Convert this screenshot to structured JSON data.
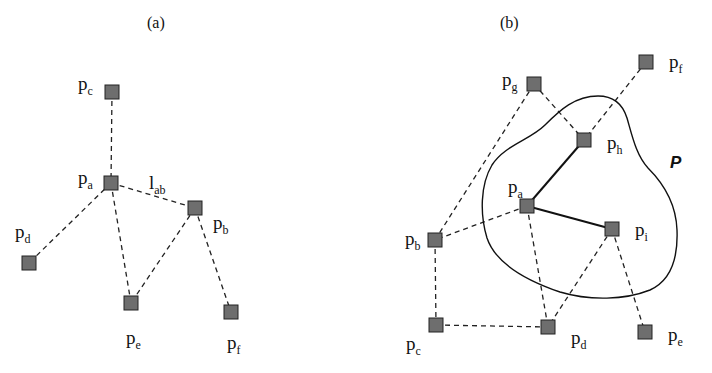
{
  "panel_a": {
    "title": "(a)",
    "nodes": [
      {
        "id": "pc",
        "base": "p",
        "sub": "c",
        "x": 112,
        "y": 92,
        "lx": 78,
        "ly": 74
      },
      {
        "id": "pa",
        "base": "p",
        "sub": "a",
        "x": 111,
        "y": 183,
        "lx": 78,
        "ly": 168
      },
      {
        "id": "pb",
        "base": "p",
        "sub": "b",
        "x": 195,
        "y": 208,
        "lx": 213,
        "ly": 213
      },
      {
        "id": "pd",
        "base": "p",
        "sub": "d",
        "x": 29,
        "y": 263,
        "lx": 15,
        "ly": 222
      },
      {
        "id": "pe",
        "base": "p",
        "sub": "e",
        "x": 131,
        "y": 303,
        "lx": 126,
        "ly": 328
      },
      {
        "id": "pf",
        "base": "p",
        "sub": "f",
        "x": 231,
        "y": 312,
        "lx": 227,
        "ly": 333
      }
    ],
    "edges": [
      {
        "from": "pc",
        "to": "pa",
        "style": "dashed"
      },
      {
        "from": "pa",
        "to": "pb",
        "style": "dashed"
      },
      {
        "from": "pa",
        "to": "pd",
        "style": "dashed"
      },
      {
        "from": "pa",
        "to": "pe",
        "style": "dashed"
      },
      {
        "from": "pb",
        "to": "pe",
        "style": "dashed"
      },
      {
        "from": "pb",
        "to": "pf",
        "style": "dashed"
      }
    ],
    "edge_label": {
      "base": "l",
      "sub": "ab",
      "x": 149,
      "y": 173
    }
  },
  "panel_b": {
    "title": "(b)",
    "region_label": "P",
    "nodes": [
      {
        "id": "pf",
        "base": "p",
        "sub": "f",
        "x": 646,
        "y": 62,
        "lx": 669,
        "ly": 52
      },
      {
        "id": "pg",
        "base": "p",
        "sub": "g",
        "x": 534,
        "y": 84,
        "lx": 502,
        "ly": 70
      },
      {
        "id": "ph",
        "base": "p",
        "sub": "h",
        "x": 584,
        "y": 140,
        "lx": 607,
        "ly": 133
      },
      {
        "id": "pa",
        "base": "p",
        "sub": "a",
        "x": 527,
        "y": 206,
        "lx": 508,
        "ly": 177
      },
      {
        "id": "pi",
        "base": "p",
        "sub": "i",
        "x": 612,
        "y": 229,
        "lx": 635,
        "ly": 220
      },
      {
        "id": "pb",
        "base": "p",
        "sub": "b",
        "x": 435,
        "y": 240,
        "lx": 405,
        "ly": 229
      },
      {
        "id": "pc",
        "base": "p",
        "sub": "c",
        "x": 436,
        "y": 325,
        "lx": 406,
        "ly": 334
      },
      {
        "id": "pd",
        "base": "p",
        "sub": "d",
        "x": 548,
        "y": 327,
        "lx": 571,
        "ly": 328
      },
      {
        "id": "pe",
        "base": "p",
        "sub": "e",
        "x": 645,
        "y": 332,
        "lx": 668,
        "ly": 325
      }
    ],
    "edges": [
      {
        "from": "pg",
        "to": "pb",
        "style": "dashed"
      },
      {
        "from": "pg",
        "to": "ph",
        "style": "dashed"
      },
      {
        "from": "pf",
        "to": "ph",
        "style": "dashed"
      },
      {
        "from": "ph",
        "to": "pa",
        "style": "solid"
      },
      {
        "from": "pa",
        "to": "pi",
        "style": "solid"
      },
      {
        "from": "pa",
        "to": "pb",
        "style": "dashed"
      },
      {
        "from": "pa",
        "to": "pd",
        "style": "dashed"
      },
      {
        "from": "pi",
        "to": "pd",
        "style": "dashed"
      },
      {
        "from": "pi",
        "to": "pe",
        "style": "dashed"
      },
      {
        "from": "pb",
        "to": "pc",
        "style": "dashed"
      },
      {
        "from": "pc",
        "to": "pd",
        "style": "dashed"
      }
    ]
  }
}
